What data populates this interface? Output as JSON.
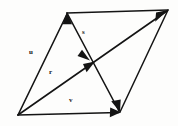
{
  "figure": {
    "name": "vector-parallelogram-diagram",
    "type": "geometry-vector-diagram",
    "background_color": "#fdfdfc",
    "stroke_color": "#141414",
    "canvas": {
      "width": 178,
      "height": 126
    }
  },
  "geometry": {
    "vertices": {
      "bottom_left": {
        "x": 18,
        "y": 115
      },
      "top_left": {
        "x": 67,
        "y": 13
      },
      "top_right": {
        "x": 168,
        "y": 10
      },
      "bottom_right": {
        "x": 120,
        "y": 112
      },
      "center": {
        "x": 93,
        "y": 63
      }
    },
    "shape": "parallelogram"
  },
  "vectors": [
    {
      "id": "u",
      "label": "u",
      "from": "bottom_left",
      "to": "top_left",
      "arrowheads": [
        "tip"
      ],
      "label_position": {
        "x": 29,
        "y": 49
      }
    },
    {
      "id": "s",
      "label": "s",
      "from": "top_left",
      "to": "bottom_right",
      "arrowheads": [
        "center",
        "tip"
      ],
      "label_position": {
        "x": 82,
        "y": 29
      }
    },
    {
      "id": "r",
      "label": "r",
      "from": "bottom_left",
      "to": "top_right",
      "arrowheads": [
        "center",
        "tip"
      ],
      "label_position": {
        "x": 49,
        "y": 69
      }
    },
    {
      "id": "v",
      "label": "v",
      "from": "bottom_left",
      "to": "bottom_right",
      "arrowheads": [
        "tip"
      ],
      "label_position": {
        "x": 69,
        "y": 97
      }
    }
  ],
  "edges": [
    {
      "id": "top-edge",
      "from": "top_left",
      "to": "top_right"
    },
    {
      "id": "right-edge",
      "from": "top_right",
      "to": "bottom_right"
    }
  ]
}
